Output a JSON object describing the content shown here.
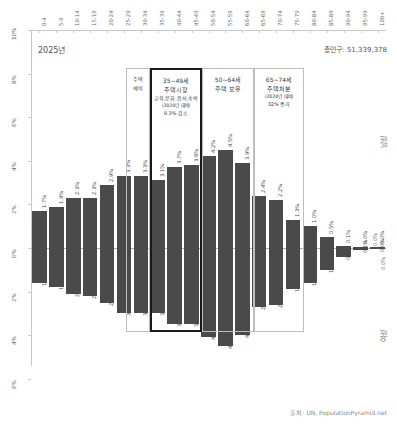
{
  "header": {
    "year_label": "2025년",
    "total_population": "총인구: 51,339,378"
  },
  "footer": {
    "source": "출처: UN, PopulationPyramid.net"
  },
  "side": {
    "male_label": "남성",
    "female_label": "여성",
    "mid_male_pct": "0.0%",
    "mid_female_pct": "0.0%"
  },
  "annotations": [
    {
      "id": "pre-housing",
      "lines": [
        "주택",
        "예비"
      ],
      "emphasis": false
    },
    {
      "id": "housing-market",
      "lines": [
        "35~49세",
        "주택시장",
        "교육,문화,음식,숙박",
        "(2020년 대비)",
        "9.3% 감소"
      ],
      "emphasis": true
    },
    {
      "id": "housing-hold",
      "lines": [
        "50~64세",
        "주택 보유"
      ],
      "emphasis": false
    },
    {
      "id": "housing-dispose",
      "lines": [
        "65~74세",
        "주택처분",
        "(2020년 대비)",
        "32% 증가"
      ],
      "emphasis": false
    }
  ],
  "chart_data": {
    "type": "bar",
    "title": "2025년",
    "subtitle": "총인구: 51,339,378",
    "xlabel": "",
    "ylabel": "%",
    "orientation": "population-pyramid-vertical",
    "categories": [
      "0-4",
      "5-9",
      "10-14",
      "15-19",
      "20-24",
      "25-29",
      "30-34",
      "35-39",
      "40-44",
      "45-49",
      "50-54",
      "55-59",
      "60-64",
      "65-69",
      "70-74",
      "75-79",
      "80-84",
      "85-89",
      "90-94",
      "95-99",
      "100+"
    ],
    "ylim": [
      -6,
      10
    ],
    "yticks": [
      "10%",
      "8%",
      "6%",
      "4%",
      "2%",
      "0%",
      "2%",
      "4%",
      "6%"
    ],
    "ytick_values": [
      10,
      8,
      6,
      4,
      2,
      0,
      -2,
      -4,
      -6
    ],
    "grid": false,
    "legend_position": "right",
    "series": [
      {
        "name": "남성",
        "values": [
          1.7,
          1.9,
          2.3,
          2.3,
          2.9,
          3.3,
          3.3,
          3.1,
          3.7,
          3.8,
          4.2,
          4.5,
          3.9,
          2.4,
          2.2,
          1.3,
          1.0,
          0.5,
          0.1,
          0.0,
          0.0
        ],
        "labels": [
          "1.7%",
          "1.9%",
          "2.3%",
          "2.3%",
          "2.9%",
          "3.3%",
          "3.3%",
          "3.1%",
          "3.7%",
          "3.8%",
          "4.2%",
          "4.5%",
          "3.9%",
          "2.4%",
          "2.2%",
          "1.3%",
          "1.0%",
          "0.5%",
          "0.1%",
          "0.0%",
          "0.0%"
        ]
      },
      {
        "name": "여성",
        "values": [
          -1.6,
          -1.8,
          -2.1,
          -2.2,
          -2.5,
          -3.0,
          -3.0,
          -3.0,
          -3.5,
          -3.5,
          -4.1,
          -4.5,
          -4.0,
          -2.7,
          -2.6,
          -1.9,
          -1.6,
          -1.0,
          -0.4,
          -0.1,
          -0.0
        ],
        "labels": [
          "1.6%",
          "1.8%",
          "2.1%",
          "2.2%",
          "2.5%",
          "3.0%",
          "3.0%",
          "3.0%",
          "3.5%",
          "3.5%",
          "4.1%",
          "4.5%",
          "4.0%",
          "2.7%",
          "2.6%",
          "1.9%",
          "1.6%",
          "1.0%",
          "0.4%",
          "0.1%",
          "0.0%"
        ]
      }
    ]
  }
}
